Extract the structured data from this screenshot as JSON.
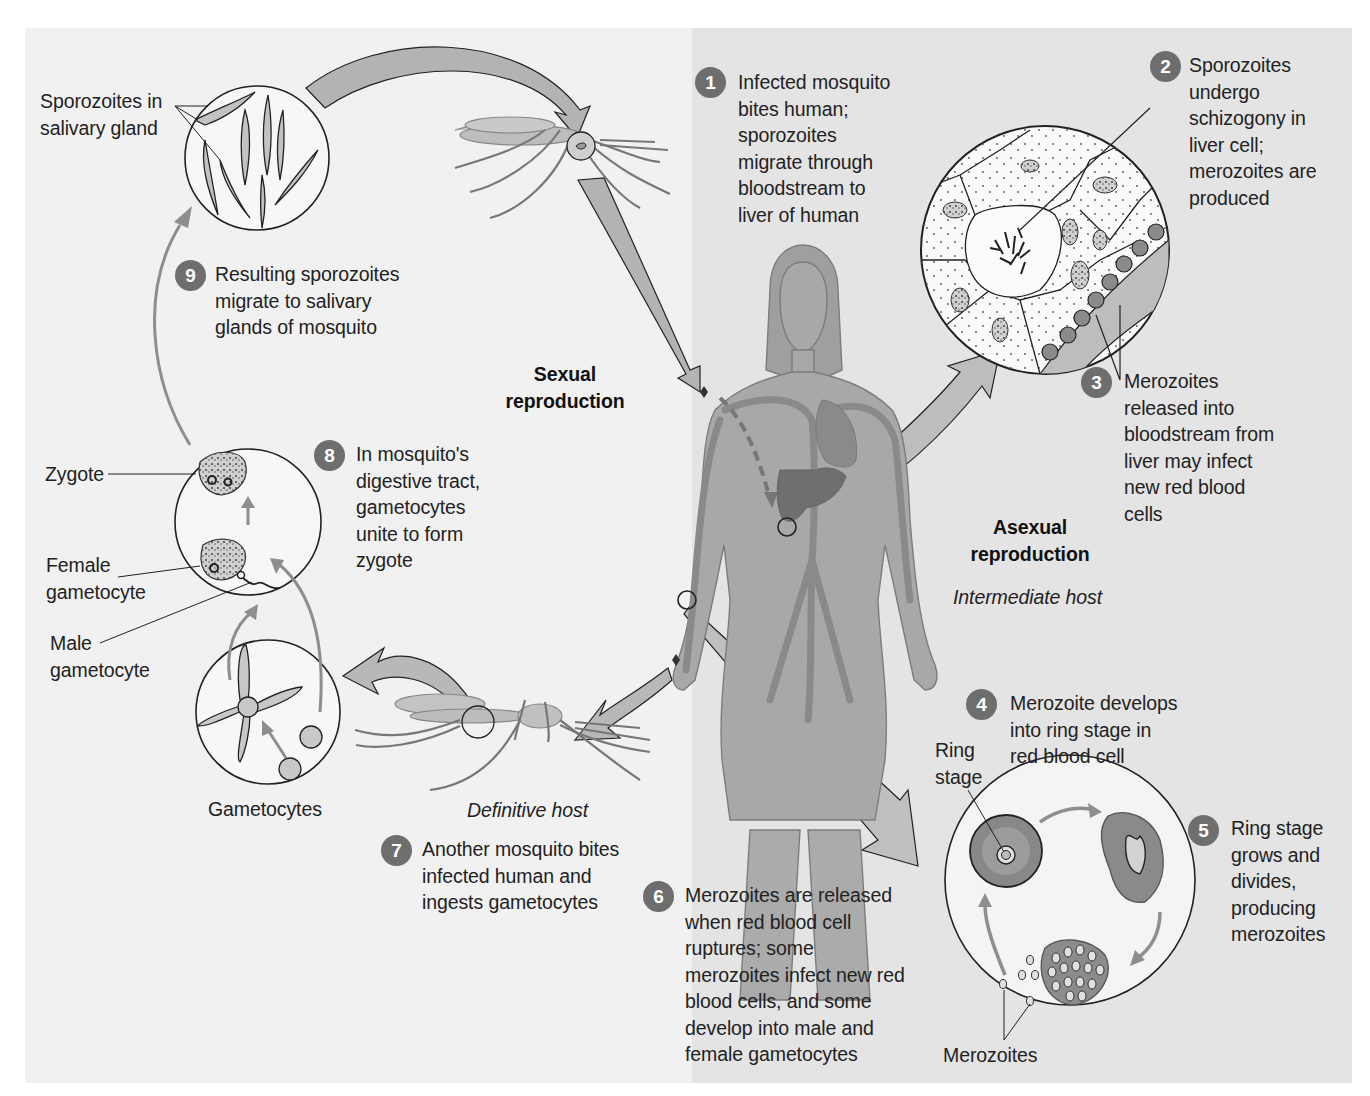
{
  "diagram": {
    "colors": {
      "left_panel": "#f1f1f1",
      "right_panel": "#e4e4e4",
      "arrow_fill": "#b3b3b3",
      "badge": "#6e6e6e",
      "body": "#a9a9a9",
      "liver": "#6f6f6f",
      "rbc": "#8a8a8a"
    },
    "regions": {
      "sexual": "Sexual\nreproduction",
      "asexual": "Asexual\nreproduction",
      "definitive_host": "Definitive host",
      "intermediate_host": "Intermediate host"
    },
    "labels": {
      "sporozoites_gland": "Sporozoites in\nsalivary gland",
      "zygote": "Zygote",
      "female_gametocyte": "Female\ngametocyte",
      "male_gametocyte": "Male\ngametocyte",
      "gametocytes": "Gametocytes",
      "ring_stage": "Ring\nstage",
      "merozoites": "Merozoites"
    },
    "steps": [
      {
        "num": "1",
        "text": "Infected mosquito\nbites human;\nsporozoites\nmigrate through\nbloodstream to\nliver of human"
      },
      {
        "num": "2",
        "text": "Sporozoites\nundergo\nschizogony in\nliver cell;\nmerozoites are\nproduced"
      },
      {
        "num": "3",
        "text": "Merozoites\nreleased into\nbloodstream from\nliver may infect\nnew red blood\ncells"
      },
      {
        "num": "4",
        "text": "Merozoite develops\ninto ring stage in\nred blood cell"
      },
      {
        "num": "5",
        "text": "Ring stage\ngrows and\ndivides,\nproducing\nmerozoites"
      },
      {
        "num": "6",
        "text": "Merozoites are released\nwhen red blood cell\nruptures; some\nmerozoites infect new red\nblood cells, and some\ndevelop into male and\nfemale gametocytes"
      },
      {
        "num": "7",
        "text": "Another mosquito bites\ninfected human and\ningests gametocytes"
      },
      {
        "num": "8",
        "text": "In mosquito's\ndigestive tract,\ngametocytes\nunite to form\nzygote"
      },
      {
        "num": "9",
        "text": "Resulting sporozoites\nmigrate to salivary\nglands of mosquito"
      }
    ]
  }
}
